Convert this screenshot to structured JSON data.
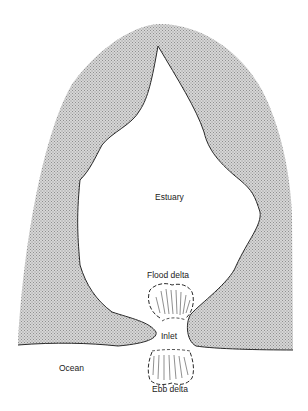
{
  "diagram": {
    "type": "estuary-cross-section-map",
    "labels": {
      "estuary": "Estuary",
      "flood_delta": "Flood delta",
      "inlet": "Inlet",
      "ocean": "Ocean",
      "ebb_delta": "Ebb delta"
    },
    "colors": {
      "land_fill": "#c9c9c9",
      "land_dot": "#8f8f8f",
      "shoreline": "#2a2a2a",
      "water": "#ffffff"
    }
  }
}
